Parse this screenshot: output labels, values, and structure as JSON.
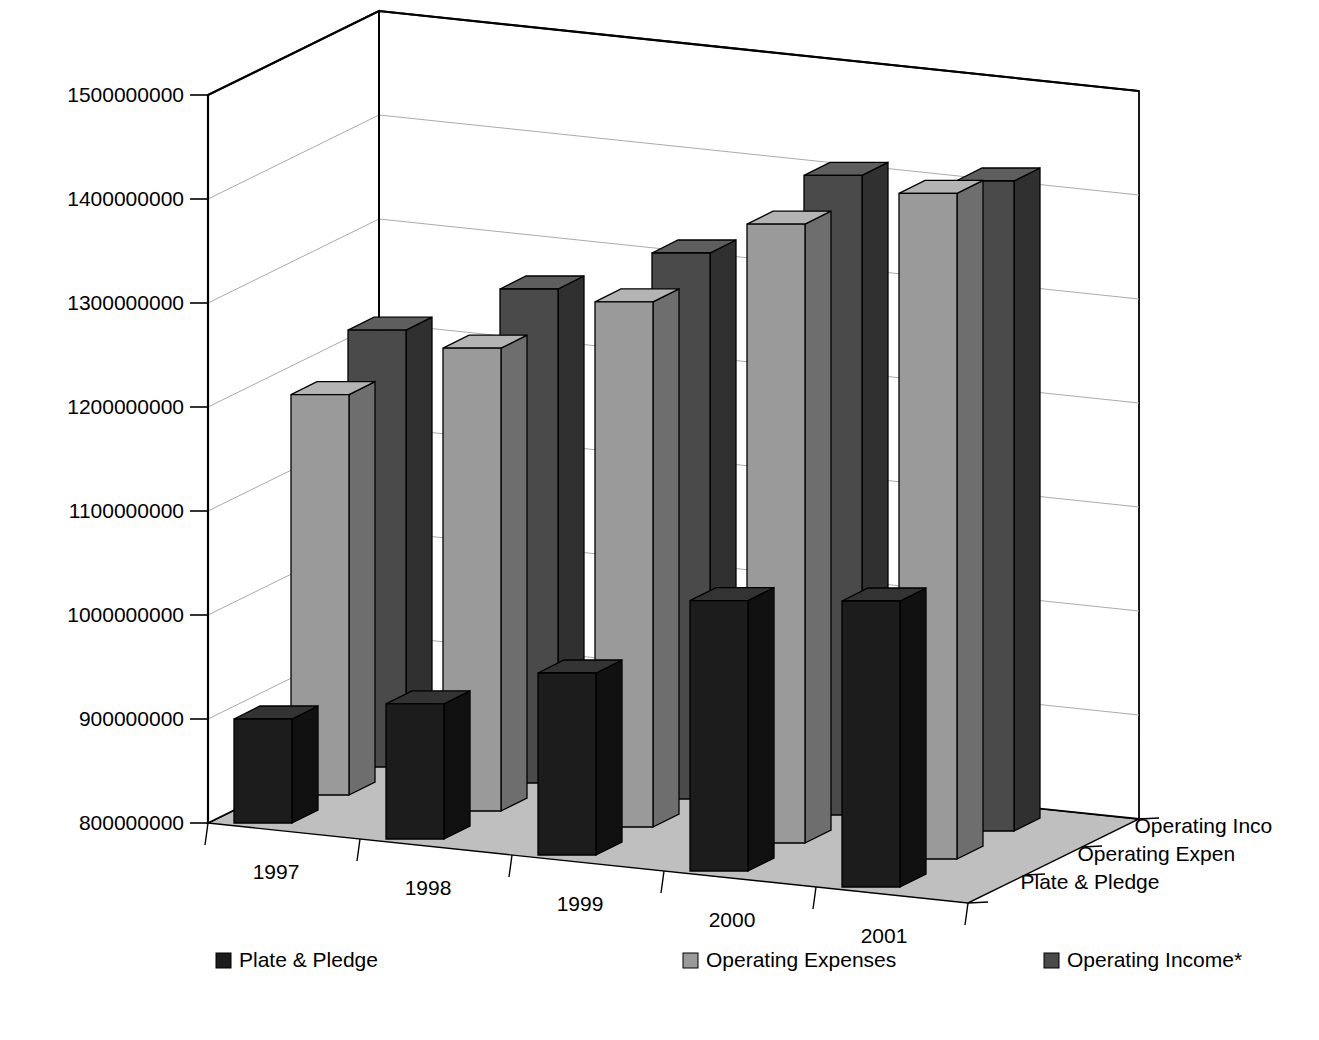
{
  "chart_data": {
    "type": "bar",
    "title": "",
    "subtitle": "",
    "xlabel": "",
    "ylabel": "",
    "zlabel": "",
    "is_3d": true,
    "grid": true,
    "legend_position": "bottom",
    "categories": [
      "1997",
      "1998",
      "1999",
      "2000",
      "2001"
    ],
    "ylim": [
      800000000,
      1500000000
    ],
    "ytick_step": 100000000,
    "ytick_labels": [
      "800000000",
      "900000000",
      "1000000000",
      "1100000000",
      "1200000000",
      "1300000000",
      "1400000000",
      "1500000000"
    ],
    "ytick_values": [
      800000000,
      900000000,
      1000000000,
      1100000000,
      1200000000,
      1300000000,
      1400000000,
      1500000000
    ],
    "series": [
      {
        "name": "Plate & Pledge",
        "axis_label": "Plate & Pledge",
        "legend_label": "Plate & Pledge",
        "color": "#1c1c1c",
        "top_color": "#333333",
        "side_color": "#111111",
        "depth_index": 0,
        "values": [
          900000000,
          930000000,
          975000000,
          1060000000,
          1075000000
        ]
      },
      {
        "name": "Operating Expenses",
        "axis_label": "Operating Expen",
        "legend_label": "Operating Expenses",
        "color": "#9a9a9a",
        "top_color": "#b4b4b4",
        "side_color": "#6e6e6e",
        "depth_index": 1,
        "values": [
          1185000000,
          1245000000,
          1305000000,
          1395000000,
          1440000000
        ]
      },
      {
        "name": "Operating Income*",
        "axis_label": "Operating Inco",
        "legend_label": "Operating Income*",
        "color": "#4a4a4a",
        "top_color": "#5e5e5e",
        "side_color": "#303030",
        "depth_index": 2,
        "values": [
          1220000000,
          1275000000,
          1325000000,
          1415000000,
          1425000000
        ]
      }
    ]
  },
  "axis": {
    "y_labels": [
      "1500000000",
      "1400000000",
      "1300000000",
      "1200000000",
      "1100000000",
      "1000000000",
      "900000000",
      "800000000"
    ],
    "x_labels": [
      "1997",
      "1998",
      "1999",
      "2000",
      "2001"
    ],
    "z_labels": [
      "Operating Inco",
      "Operating Expen",
      "Plate & Pledge"
    ]
  },
  "legend": {
    "items": [
      {
        "label": "Plate & Pledge",
        "swatch": "#1c1c1c"
      },
      {
        "label": "Operating Expenses",
        "swatch": "#9a9a9a"
      },
      {
        "label": "Operating Income*",
        "swatch": "#4a4a4a"
      }
    ]
  },
  "colors": {
    "background": "#ffffff",
    "floor": "#bfbfbf",
    "wall": "#ffffff",
    "grid_line": "#aaaaaa",
    "axis_line": "#000000",
    "text": "#000000"
  }
}
